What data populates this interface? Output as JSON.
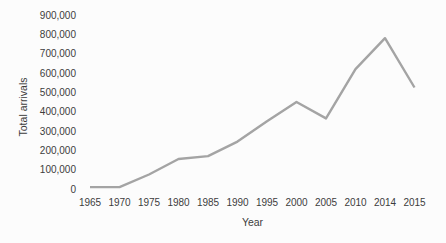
{
  "chart_data": {
    "type": "line",
    "title": "",
    "xlabel": "Year",
    "ylabel": "Total arrivals",
    "categories": [
      "1965",
      "1970",
      "1975",
      "1980",
      "1985",
      "1990",
      "1995",
      "2000",
      "2005",
      "2010",
      "2014",
      "2015"
    ],
    "values": [
      10000,
      10000,
      75000,
      155000,
      170000,
      245000,
      350000,
      450000,
      365000,
      620000,
      780000,
      525000
    ],
    "ylim": [
      0,
      900000
    ],
    "ytick_step": 100000,
    "grid": false,
    "legend": null,
    "axis_lines": false,
    "line_color": "#a4a4a4",
    "line_width": 2.4,
    "label_color": "#3c3c3c",
    "background_color": "#fcfcfc"
  }
}
